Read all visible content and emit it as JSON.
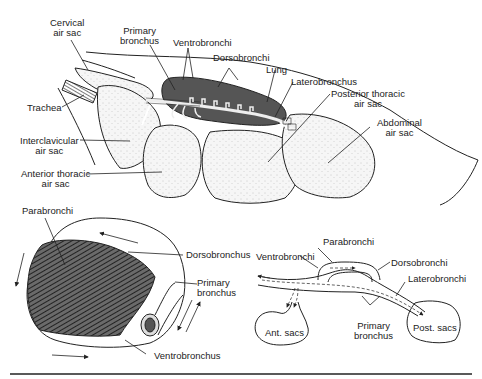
{
  "figure": {
    "top_diagram": {
      "labels": {
        "cervical_air_sac": [
          "Cervical",
          "air sac"
        ],
        "primary_bronchus": [
          "Primary",
          "bronchus"
        ],
        "ventrobronchi": "Ventrobronchi",
        "dorsobronchi": "Dorsobronchi",
        "lung": "Lung",
        "laterobronchus": "Laterobronchus",
        "trachea": "Trachea",
        "posterior_thoracic_air_sac": [
          "Posterior thoracic",
          "air sac"
        ],
        "abdominal_air_sac": [
          "Abdominal",
          "air sac"
        ],
        "interclavicular_air_sac": [
          "Interclavicular",
          "air sac"
        ],
        "anterior_thoracic_air_sac": [
          "Anterior thoracic",
          "air sac"
        ]
      }
    },
    "bottom_left_diagram": {
      "labels": {
        "parabronchi": "Parabronchi",
        "dorsobronchus": "Dorsobronchus",
        "primary_bronchus": [
          "Primary",
          "bronchus"
        ],
        "ventrobronchus": "Ventrobronchus"
      }
    },
    "bottom_right_diagram": {
      "labels": {
        "parabronchi": "Parabronchi",
        "ventrobronchi": "Ventrobronchi",
        "dorsobronchi": "Dorsobronchi",
        "laterobronchi": "Laterobronchi",
        "ant_sacs": "Ant. sacs",
        "primary_bronchus": [
          "Primary",
          "bronchus"
        ],
        "post_sacs": "Post. sacs"
      }
    },
    "colors": {
      "ink": "#222222",
      "lung_fill": "#555555",
      "sac_fill": "#f4f4f4",
      "background": "#ffffff"
    }
  }
}
